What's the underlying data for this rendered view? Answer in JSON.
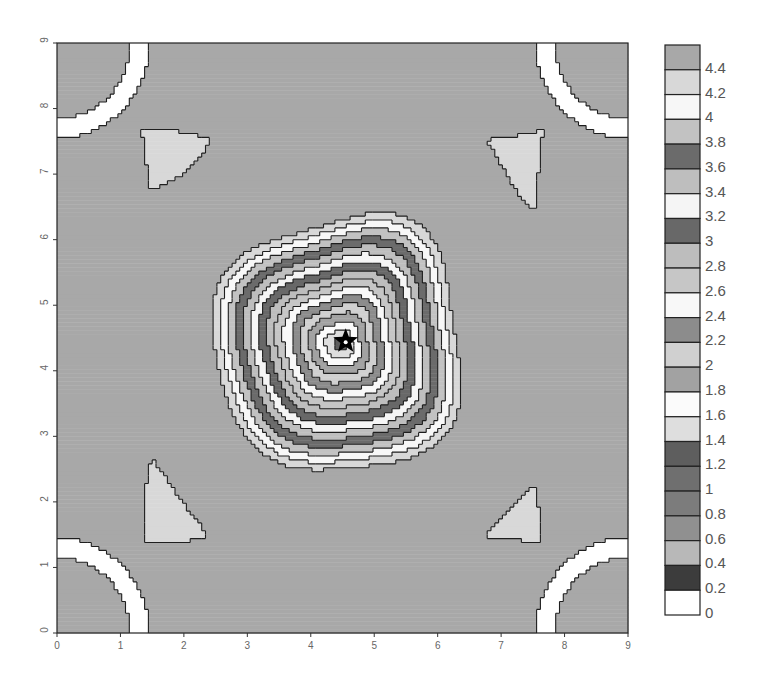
{
  "chart_data": {
    "type": "heatmap",
    "subtype": "filled-contour",
    "title": "",
    "xlabel": "",
    "ylabel": "",
    "xlim": [
      0,
      9
    ],
    "ylim": [
      0,
      9
    ],
    "x_ticks": [
      "0",
      "1",
      "2",
      "3",
      "4",
      "5",
      "6",
      "7",
      "8",
      "9"
    ],
    "y_ticks": [
      "0",
      "1",
      "2",
      "3",
      "4",
      "5",
      "6",
      "7",
      "8",
      "9"
    ],
    "grid": false,
    "contour_levels": [
      0,
      0.2,
      0.4,
      0.6,
      0.8,
      1,
      1.2,
      1.4,
      1.6,
      1.8,
      2,
      2.2,
      2.4,
      2.6,
      2.8,
      3,
      3.2,
      3.4,
      3.6,
      3.8,
      4,
      4.2,
      4.4
    ],
    "legend": {
      "position": "right",
      "labels": [
        "4.4",
        "4.2",
        "4",
        "3.8",
        "3.6",
        "3.4",
        "3.2",
        "3",
        "2.8",
        "2.6",
        "2.4",
        "2.2",
        "2",
        "1.8",
        "1.6",
        "1.4",
        "1.2",
        "1",
        "0.8",
        "0.6",
        "0.4",
        "0.2",
        "0"
      ],
      "band_colors_low_to_high": [
        "#ffffff",
        "#3c3c3c",
        "#b8b8b8",
        "#909090",
        "#7c7c7c",
        "#6f6f6f",
        "#5e5e5e",
        "#dedede",
        "#fbfbfb",
        "#a2a2a2",
        "#d0d0d0",
        "#8c8c8c",
        "#f8f8f8",
        "#c6c6c6",
        "#bdbdbd",
        "#686868",
        "#f5f5f5",
        "#bebebe",
        "#6b6b6b",
        "#c2c2c2",
        "#f7f7f7",
        "#d8d8d8",
        "#a8a8a8"
      ]
    },
    "features": {
      "marker": {
        "shape": "star",
        "x": 4.55,
        "y": 4.45,
        "color": "#000000"
      },
      "center_minimum": {
        "x": 4.4,
        "y": 4.4,
        "value_range": "1.2-1.4"
      },
      "corner_plateaus": {
        "value_range": ">4.4",
        "locations": [
          "(0-1,0-1)",
          "(0-1,8-9)",
          "(8-9,0-1)",
          "(8-9,8-9)"
        ]
      },
      "local_islands": [
        {
          "x": 2.0,
          "y": 2.05,
          "note": "small closed contour"
        },
        {
          "x": 4.5,
          "y": 1.5,
          "note": "elongated plateau"
        },
        {
          "x": 1.4,
          "y": 4.9,
          "note": "elongated plateau"
        },
        {
          "x": 7.5,
          "y": 4.5,
          "note": "elongated plateau"
        },
        {
          "x": 4.2,
          "y": 7.5,
          "note": "elongated plateau"
        },
        {
          "x": 1.8,
          "y": 6.9,
          "note": "small plateau"
        }
      ]
    }
  },
  "layout": {
    "plot": {
      "left": 57,
      "top": 43,
      "right": 628,
      "bottom": 633
    },
    "legend_box": {
      "left": 665,
      "top": 45,
      "width": 35,
      "height": 570
    }
  }
}
